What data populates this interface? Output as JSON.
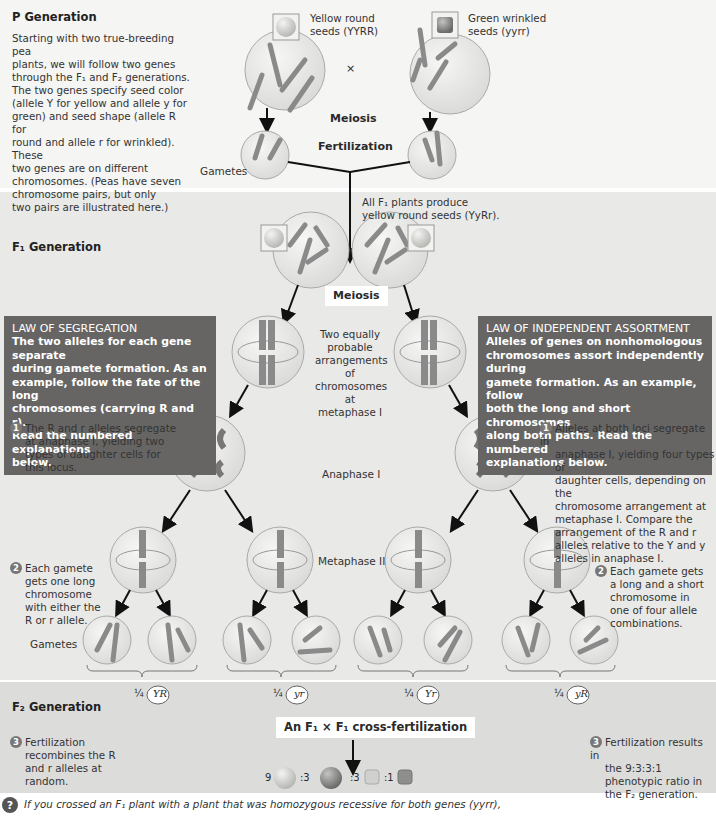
{
  "p_generation": {
    "title": "P Generation",
    "description": "Starting with two true-breeding pea plants, we will follow two genes through the F1 and F2 generations. The two genes specify seed color (allele Y for yellow and allele y for green) and seed shape (allele R for round and allele r for wrinkled). These two genes are on different chromosomes. (Peas have seven chromosome pairs, but only two pairs are illustrated here.)",
    "description_lines": [
      "Starting with two true-breeding pea",
      "plants, we will follow two genes",
      "through the F₁ and F₂ generations.",
      "The two genes specify seed color",
      "(allele Y for yellow and allele y for",
      "green) and seed shape (allele R for",
      "round and allele r for wrinkled). These",
      "two genes are on different",
      "chromosomes. (Peas have seven",
      "chromosome pairs, but only",
      "two pairs are illustrated here.)"
    ],
    "parent1_label": [
      "Yellow round",
      "seeds (YYRR)"
    ],
    "parent2_label": [
      "Green wrinkled",
      "seeds (yyrr)"
    ],
    "cross_symbol": "×",
    "meiosis_label": "Meiosis",
    "fertilization_label": "Fertilization",
    "gametes_label": "Gametes",
    "parent1_alleles": [
      "Y",
      "Y",
      "R",
      "R"
    ],
    "parent2_alleles": [
      "y",
      "y",
      "r",
      "r"
    ],
    "gamete1_alleles": [
      "R",
      "Y"
    ],
    "gamete2_alleles": [
      "y",
      "r"
    ]
  },
  "f1_generation": {
    "title": "F₁ Generation",
    "f1_note": [
      "All F₁ plants produce",
      "yellow round seeds (YyRr)."
    ],
    "meiosis_label": "Meiosis",
    "metaphase1_caption": [
      "Two equally",
      "probable",
      "arrangements",
      "of chromosomes",
      "at metaphase I"
    ],
    "anaphase1_label": "Anaphase I",
    "metaphase2_label": "Metaphase II",
    "gametes_label": "Gametes",
    "law_segregation": {
      "title": "LAW OF SEGREGATION",
      "lines": [
        "The two alleles for each gene separate",
        "during gamete formation. As an",
        "example, follow the fate of the long",
        "chromosomes (carrying R and r).",
        "Read the numbered explanations",
        "below."
      ]
    },
    "law_independent": {
      "title": "LAW OF INDEPENDENT ASSORTMENT",
      "lines": [
        "Alleles of genes on nonhomologous",
        "chromosomes assort independently during",
        "gamete formation. As an example, follow",
        "both the long and short chromosomes",
        "along both paths. Read the numbered",
        "explanations below."
      ]
    },
    "seg_step1": {
      "num": "1",
      "lines": [
        "The R and r alleles segregate",
        "at anaphase I, yielding two",
        "types of daughter cells for",
        "this locus."
      ]
    },
    "seg_step2": {
      "num": "2",
      "lines": [
        "Each gamete",
        "gets one long",
        "chromosome",
        "with either the",
        "R or r allele."
      ]
    },
    "ind_step1": {
      "num": "1",
      "lines": [
        "Alleles at both loci segregate in",
        "anaphase I, yielding four types of",
        "daughter cells, depending on the",
        "chromosome arrangement at",
        "metaphase I. Compare the",
        "arrangement of the R and r",
        "alleles relative to the Y and y",
        "alleles in anaphase I."
      ]
    },
    "ind_step2": {
      "num": "2",
      "lines": [
        "Each gamete gets",
        "a long and a short",
        "chromosome in",
        "one of four allele",
        "combinations."
      ]
    },
    "gamete_fractions": [
      {
        "fraction": "¼",
        "genotype": "YR"
      },
      {
        "fraction": "¼",
        "genotype": "yr"
      },
      {
        "fraction": "¼",
        "genotype": "Yr"
      },
      {
        "fraction": "¼",
        "genotype": "yR"
      }
    ]
  },
  "f2_generation": {
    "title": "F₂ Generation",
    "cross_label": "An F₁ × F₁ cross-fertilization",
    "left_step": {
      "num": "3",
      "lines": [
        "Fertilization",
        "recombines the R",
        "and r alleles at",
        "random."
      ]
    },
    "right_step": {
      "num": "3",
      "lines": [
        "Fertilization results in",
        "the 9:3:3:1",
        "phenotypic ratio in",
        "the F₂ generation."
      ]
    },
    "ratio": [
      {
        "count": "9",
        "phenotype": "yellow-round"
      },
      {
        "count": ":3",
        "phenotype": "green-round"
      },
      {
        "count": ":3",
        "phenotype": "yellow-wrinkled"
      },
      {
        "count": ":1",
        "phenotype": "green-wrinkled"
      }
    ]
  },
  "question": {
    "icon": "?",
    "text": "If you crossed an F₁ plant with a plant that was homozygous recessive for both genes (yyrr),"
  },
  "colors": {
    "law_box": "#666564",
    "chromosome": "#8a8a8a",
    "yellow_seed": "#d8d8d4",
    "green_seed": "#8e8e8c",
    "cell": "#ececea"
  }
}
